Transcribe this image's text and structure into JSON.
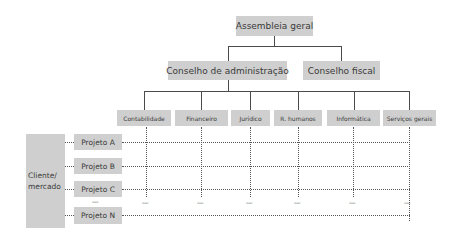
{
  "diagram": {
    "type": "organizational-matrix",
    "top": {
      "label": "Assembleia geral"
    },
    "councils": [
      {
        "label": "Conselho de administração"
      },
      {
        "label": "Conselho fiscal"
      }
    ],
    "departments": [
      {
        "label": "Contabilidade"
      },
      {
        "label": "Financeiro"
      },
      {
        "label": "Jurídico"
      },
      {
        "label": "R. humanos"
      },
      {
        "label": "Informática"
      },
      {
        "label": "Serviços gerais"
      }
    ],
    "client": {
      "label": "Cliente/ mercado"
    },
    "projects": [
      {
        "label": "Projeto A"
      },
      {
        "label": "Projeto B"
      },
      {
        "label": "Projeto C"
      },
      {
        "label": "Projeto N"
      }
    ],
    "ellipsis": "---",
    "colors": {
      "box": "#cfcfcf",
      "line": "#4a4a4a",
      "text": "#3a3a3a"
    }
  }
}
